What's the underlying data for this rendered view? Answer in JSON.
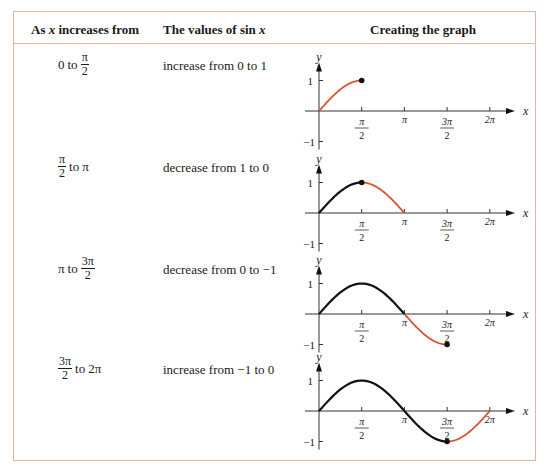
{
  "table": {
    "headers": {
      "col1_prefix": "As",
      "col1_var": "x",
      "col1_suffix": "increases from",
      "col2_prefix": "The values of sin",
      "col2_var": "x",
      "col3": "Creating the graph"
    },
    "rows": [
      {
        "range": {
          "start": "0",
          "start_frac": null,
          "connector": "to",
          "end_num": "π",
          "end_den": "2",
          "end": null
        },
        "values": "increase from 0 to 1"
      },
      {
        "range": {
          "start_num": "π",
          "start_den": "2",
          "connector": "to",
          "end": "π"
        },
        "values": "decrease from 1 to 0"
      },
      {
        "range": {
          "start": "π",
          "connector": "to",
          "end_num": "3π",
          "end_den": "2"
        },
        "values": "decrease from 0 to −1"
      },
      {
        "range": {
          "start_num": "3π",
          "start_den": "2",
          "connector": "to",
          "end": "2π"
        },
        "values": "increase from −1 to 0"
      }
    ]
  },
  "graph_labels": {
    "y_axis": "y",
    "x_axis": "x",
    "y_ticks": [
      "1",
      "−1"
    ],
    "x_ticks": [
      {
        "num": "π",
        "den": "2"
      },
      {
        "single": "π"
      },
      {
        "num": "3π",
        "den": "2"
      },
      {
        "single": "2π"
      }
    ]
  },
  "colors": {
    "highlight_curve": "#d9542c",
    "prior_curve": "#111111",
    "border": "#e3b3a8"
  },
  "chart_data": [
    {
      "type": "line",
      "title": "sin x on [0, π/2]",
      "highlight_range": [
        0,
        1.5708
      ],
      "prior_range": null,
      "endpoint": [
        1.5708,
        1
      ],
      "ylim": [
        -1,
        1
      ],
      "xlim": [
        0,
        6.2832
      ]
    },
    {
      "type": "line",
      "title": "sin x on [π/2, π]",
      "highlight_range": [
        1.5708,
        3.1416
      ],
      "prior_range": [
        0,
        1.5708
      ],
      "endpoint": [
        1.5708,
        1
      ],
      "ylim": [
        -1,
        1
      ],
      "xlim": [
        0,
        6.2832
      ]
    },
    {
      "type": "line",
      "title": "sin x on [π, 3π/2]",
      "highlight_range": [
        3.1416,
        4.7124
      ],
      "prior_range": [
        0,
        3.1416
      ],
      "endpoint": [
        4.7124,
        -1
      ],
      "ylim": [
        -1,
        1
      ],
      "xlim": [
        0,
        6.2832
      ]
    },
    {
      "type": "line",
      "title": "sin x on [3π/2, 2π]",
      "highlight_range": [
        4.7124,
        6.2832
      ],
      "prior_range": [
        0,
        4.7124
      ],
      "endpoint": [
        4.7124,
        -1
      ],
      "ylim": [
        -1,
        1
      ],
      "xlim": [
        0,
        6.2832
      ]
    }
  ]
}
